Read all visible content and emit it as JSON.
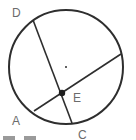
{
  "diagram": {
    "type": "circle-with-intersecting-chords",
    "colors": {
      "stroke": "#2e2e2e",
      "label": "#6b6b6b",
      "background": "#ffffff"
    },
    "circle": {
      "cx": 66,
      "cy": 67,
      "r": 57
    },
    "center_dot": {
      "x": 66,
      "y": 67
    },
    "points": {
      "D": {
        "label": "D",
        "x": 33,
        "y": 20
      },
      "C": {
        "label": "C",
        "x": 72,
        "y": 123
      },
      "A": {
        "label": "A",
        "x": 34,
        "y": 111
      },
      "F": {
        "x": 121,
        "y": 54
      },
      "E": {
        "label": "E",
        "x": 62,
        "y": 93
      }
    },
    "chords": [
      {
        "name": "chord-DC",
        "from": "D",
        "to": "C"
      },
      {
        "name": "chord-A-right",
        "from": "A",
        "to": "F"
      }
    ],
    "labels": {
      "D": "D",
      "A": "A",
      "E": "E",
      "C": "C"
    }
  }
}
